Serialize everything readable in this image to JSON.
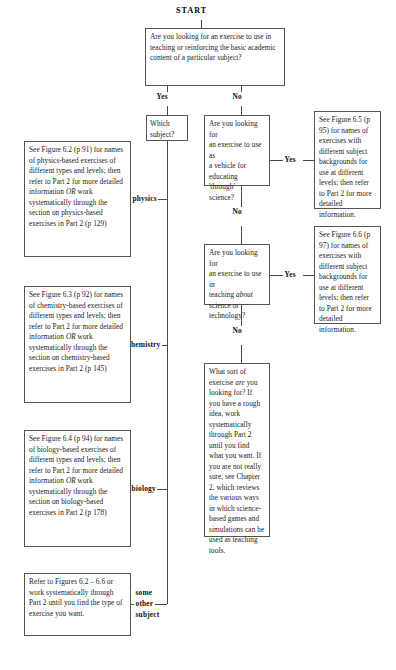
{
  "diagram": {
    "title": "START",
    "type": "flowchart",
    "nodes": {
      "q1": {
        "id": "q1",
        "text": "Are you looking for an exercise to use in teaching or reinforcing the basic academic content of a particular subject?"
      },
      "which_subject": {
        "id": "which_subject",
        "text": "Which subject?"
      },
      "q2": {
        "id": "q2",
        "line1": "Are you looking for",
        "line2": "an exercise to use as",
        "line3": "a vehicle for",
        "line4": "educating 'through'",
        "line5": "science?"
      },
      "q3": {
        "id": "q3",
        "line1": "Are you looking for",
        "line2": "an exercise to use in",
        "line3_pre": "teaching ",
        "line3_em": "about",
        "line4": "science or",
        "line5": "technology?"
      },
      "fig65": {
        "id": "fig65",
        "text": "See Figure 6.5 (p 95) for names of exercises with different subject backgrounds for use at different levels; then refer to Part 2 for more detailed information."
      },
      "fig66": {
        "id": "fig66",
        "text": "See Figure 6.6 (p 97) for names of exercises with different subject backgrounds for use at different levels; then refer to Part 2 for more detailed information."
      },
      "physics": {
        "id": "physics",
        "part1": "See Figure 6.2 (p 91) for names of physics-based exercises of different types and levels; then refer to Part 2 for more detailed information ",
        "em": "OR",
        "part2": " work systematically through the section on physics-based exercises in Part 2 (p 129)"
      },
      "chemistry": {
        "id": "chemistry",
        "part1": "See Figure 6.3 (p 92) for names of chemistry-based exercises of different types and levels; then refer to Part 2 for more detailed information ",
        "em": "OR",
        "part2": " work systematically through the section on chemistry-based exercises in Part 2 (p 145)"
      },
      "biology": {
        "id": "biology",
        "part1": "See Figure 6.4 (p 94) for names of biology-based exercises of different types and levels; then refer to Part 2 for more detailed information ",
        "em": "OR",
        "part2": " work systematically through the section on biology-based exercises in Part 2 (p 178)"
      },
      "other": {
        "id": "other",
        "text": "Refer to Figures 6.2 – 6.6 or work systematically through Part 2 until you find the type of exercise you want."
      },
      "final": {
        "id": "final",
        "part1": "What sort of exercise ",
        "em": "are",
        "part2": " you looking for? If you have a rough idea, work systematically through Part 2 until you find what you want. If you are not really sure, see Chapter 2, which reviews the various ways in which science-based games and simulations can be used as teaching tools."
      }
    },
    "edge_labels": {
      "yes1": "Yes",
      "no1": "No",
      "yes2": "Yes",
      "no2": "No",
      "yes3": "Yes",
      "no3": "No",
      "physics": "physics",
      "chemistry": "chemistry",
      "biology": "biology",
      "other_l1": "some",
      "other_l2": "other",
      "other_l3": "subject"
    }
  }
}
